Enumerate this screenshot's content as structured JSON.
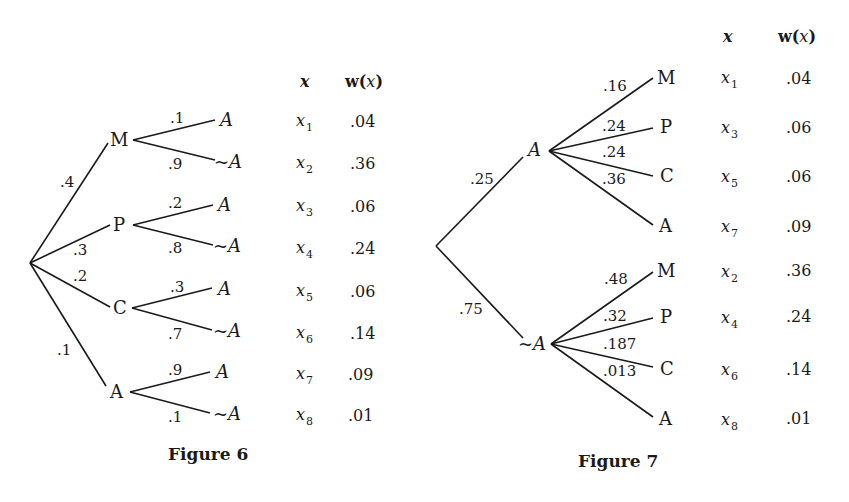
{
  "figure6": {
    "caption": "Figure 6",
    "header": {
      "x": "x",
      "w": "w(",
      "w_var": "x",
      "w_close": ")"
    },
    "root_branches": [
      {
        "node": "M",
        "prob": ".4"
      },
      {
        "node": "P",
        "prob": ".3"
      },
      {
        "node": "C",
        "prob": ".2"
      },
      {
        "node": "A",
        "prob": ".1"
      }
    ],
    "leaves": [
      {
        "parent": "M",
        "prob": ".1",
        "label": "A",
        "x_var": "x",
        "x_sub": "1",
        "w": ".04"
      },
      {
        "parent": "M",
        "prob": ".9",
        "label": "~A",
        "x_var": "x",
        "x_sub": "2",
        "w": ".36"
      },
      {
        "parent": "P",
        "prob": ".2",
        "label": "A",
        "x_var": "x",
        "x_sub": "3",
        "w": ".06"
      },
      {
        "parent": "P",
        "prob": ".8",
        "label": "~A",
        "x_var": "x",
        "x_sub": "4",
        "w": ".24"
      },
      {
        "parent": "C",
        "prob": ".3",
        "label": "A",
        "x_var": "x",
        "x_sub": "5",
        "w": ".06"
      },
      {
        "parent": "C",
        "prob": ".7",
        "label": "~A",
        "x_var": "x",
        "x_sub": "6",
        "w": ".14"
      },
      {
        "parent": "A",
        "prob": ".9",
        "label": "A",
        "x_var": "x",
        "x_sub": "7",
        "w": ".09"
      },
      {
        "parent": "A",
        "prob": ".1",
        "label": "~A",
        "x_var": "x",
        "x_sub": "8",
        "w": ".01"
      }
    ]
  },
  "figure7": {
    "caption": "Figure 7",
    "header": {
      "x": "x",
      "w": "w(",
      "w_var": "x",
      "w_close": ")"
    },
    "root_branches": [
      {
        "node": "A",
        "prob": ".25"
      },
      {
        "node": "~A",
        "prob": ".75"
      }
    ],
    "leaves": [
      {
        "parent": "A",
        "prob": ".16",
        "label": "M",
        "x_var": "x",
        "x_sub": "1",
        "w": ".04"
      },
      {
        "parent": "A",
        "prob": ".24",
        "label": "P",
        "x_var": "x",
        "x_sub": "3",
        "w": ".06"
      },
      {
        "parent": "A",
        "prob": ".24",
        "label": "C",
        "x_var": "x",
        "x_sub": "5",
        "w": ".06"
      },
      {
        "parent": "A",
        "prob": ".36",
        "label": "A",
        "x_var": "x",
        "x_sub": "7",
        "w": ".09"
      },
      {
        "parent": "~A",
        "prob": ".48",
        "label": "M",
        "x_var": "x",
        "x_sub": "2",
        "w": ".36"
      },
      {
        "parent": "~A",
        "prob": ".32",
        "label": "P",
        "x_var": "x",
        "x_sub": "4",
        "w": ".24"
      },
      {
        "parent": "~A",
        "prob": ".187",
        "label": "C",
        "x_var": "x",
        "x_sub": "6",
        "w": ".14"
      },
      {
        "parent": "~A",
        "prob": ".013",
        "label": "A",
        "x_var": "x",
        "x_sub": "8",
        "w": ".01"
      }
    ]
  }
}
